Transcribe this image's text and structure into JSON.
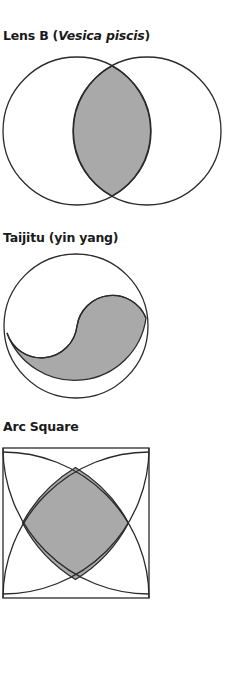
{
  "figures": [
    {
      "id": "lens",
      "title_prefix": "Lens B (",
      "title_italic": "Vesica piscis",
      "title_suffix": ")",
      "shape": "two overlapping circles with shaded lens-shaped intersection"
    },
    {
      "id": "taijitu",
      "title": "Taijitu (yin yang)",
      "shape": "circle divided by S-curve, lower half shaded"
    },
    {
      "id": "arcsquare",
      "title": "Arc Square",
      "shape": "square with four corner-centered arcs, central curved region shaded"
    }
  ],
  "colors": {
    "stroke": "#2a2a2a",
    "fill_shade": "#a9a9a9",
    "background": "#ffffff"
  }
}
